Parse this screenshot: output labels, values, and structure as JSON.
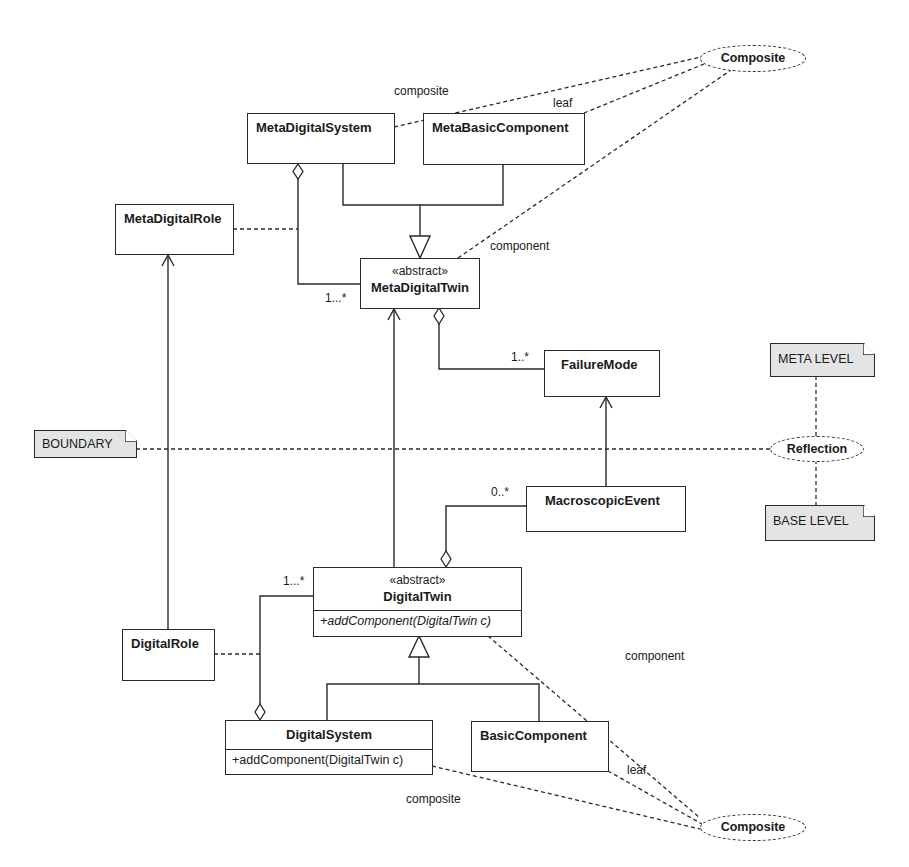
{
  "diagram": {
    "type": "UML class diagram",
    "classes": {
      "meta_digital_system": {
        "name": "MetaDigitalSystem"
      },
      "meta_basic_component": {
        "name": "MetaBasicComponent"
      },
      "meta_digital_role": {
        "name": "MetaDigitalRole"
      },
      "meta_digital_twin": {
        "stereotype": "«abstract»",
        "name": "MetaDigitalTwin"
      },
      "failure_mode": {
        "name": "FailureMode"
      },
      "macroscopic_event": {
        "name": "MacroscopicEvent"
      },
      "digital_twin": {
        "stereotype": "«abstract»",
        "name": "DigitalTwin",
        "operation": "+addComponent(DigitalTwin c)"
      },
      "digital_role": {
        "name": "DigitalRole"
      },
      "digital_system": {
        "name": "DigitalSystem",
        "operation": "+addComponent(DigitalTwin c)"
      },
      "basic_component": {
        "name": "BasicComponent"
      }
    },
    "collaborations": {
      "composite_top": "Composite",
      "composite_bottom": "Composite",
      "reflection": "Reflection"
    },
    "notes": {
      "meta_level": "META LEVEL",
      "base_level": "BASE LEVEL",
      "boundary": "BOUNDARY"
    },
    "role_labels": {
      "top_composite": "composite",
      "top_leaf": "leaf",
      "top_component": "component",
      "bottom_component": "component",
      "bottom_leaf": "leaf",
      "bottom_composite": "composite"
    },
    "multiplicities": {
      "meta_system_to_twin": "1...*",
      "meta_twin_to_failure": "1..*",
      "twin_to_event": "0..*",
      "system_to_twin": "1...*"
    }
  }
}
